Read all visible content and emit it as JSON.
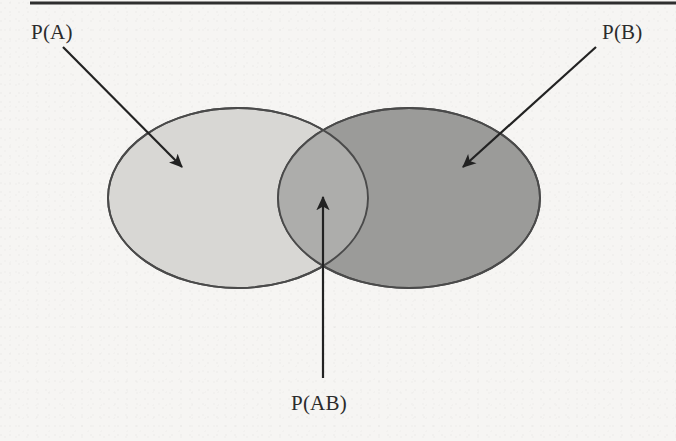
{
  "figure": {
    "type": "venn-diagram",
    "caption_rule": "horizontal-rule-top",
    "background_color": "#f6f5f3",
    "labels": {
      "set_a": "P(A)",
      "set_b": "P(B)",
      "intersection": "P(AB)"
    },
    "regions": [
      {
        "name": "set-a",
        "label": "P(A)",
        "fill_color": "#d8d7d4",
        "stroke_color": "#4a4a4a",
        "cx": 238,
        "cy": 198,
        "rx": 130,
        "ry": 90
      },
      {
        "name": "set-b",
        "label": "P(B)",
        "fill_color": "#9b9b99",
        "stroke_color": "#4a4a4a",
        "cx": 409,
        "cy": 198,
        "rx": 131,
        "ry": 90
      },
      {
        "name": "intersection-ab",
        "label": "P(AB)",
        "fill_color": "#adadab",
        "stroke_color": "#4a4a4a"
      }
    ],
    "annotations": [
      {
        "name": "pointer-to-set-a",
        "label": "P(A)",
        "from_x": 63,
        "from_y": 47,
        "to_x": 182,
        "to_y": 167,
        "color": "#222222"
      },
      {
        "name": "pointer-to-set-b",
        "label": "P(B)",
        "from_x": 596,
        "from_y": 47,
        "to_x": 463,
        "to_y": 167,
        "color": "#222222"
      },
      {
        "name": "pointer-to-intersection",
        "label": "P(AB)",
        "from_x": 323,
        "from_y": 378,
        "to_x": 323,
        "to_y": 197,
        "color": "#222222"
      }
    ],
    "rule": {
      "name": "top-divider",
      "x1": 30,
      "y1": 3,
      "x2": 676,
      "y2": 3,
      "color": "#2e2e2e",
      "thickness": 3
    }
  }
}
